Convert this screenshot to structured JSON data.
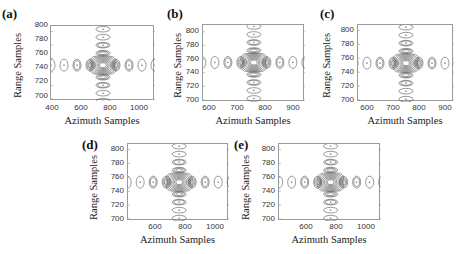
{
  "chart_data": [
    {
      "type": "contour",
      "panel": "(a)",
      "xlabel": "Azimuth Samples",
      "ylabel": "Range Samples",
      "xticks": [
        "400",
        "600",
        "800",
        "1000"
      ],
      "yticks": [
        "800",
        "780",
        "760",
        "740",
        "720",
        "700"
      ],
      "xlim": [
        390,
        1110
      ],
      "ylim": [
        697,
        808
      ],
      "peak": {
        "x": 750,
        "y": 750
      },
      "grid": false
    },
    {
      "type": "contour",
      "panel": "(b)",
      "xlabel": "Azimuth Samples",
      "ylabel": "Range Samples",
      "xticks": [
        "600",
        "700",
        "800",
        "900"
      ],
      "yticks": [
        "800",
        "780",
        "760",
        "740",
        "720",
        "700"
      ],
      "xlim": [
        570,
        935
      ],
      "ylim": [
        697,
        810
      ],
      "peak": {
        "x": 752,
        "y": 755
      },
      "grid": false
    },
    {
      "type": "contour",
      "panel": "(c)",
      "xlabel": "Azimuth Samples",
      "ylabel": "Range Samples",
      "xticks": [
        "600",
        "700",
        "800",
        "900"
      ],
      "yticks": [
        "800",
        "780",
        "760",
        "740",
        "720",
        "700"
      ],
      "xlim": [
        560,
        930
      ],
      "ylim": [
        697,
        808
      ],
      "peak": {
        "x": 745,
        "y": 753
      },
      "grid": false
    },
    {
      "type": "contour",
      "panel": "(d)",
      "xlabel": "Azimuth Samples",
      "ylabel": "Range Samples",
      "xticks": [
        "600",
        "800",
        "1000"
      ],
      "yticks": [
        "800",
        "780",
        "760",
        "740",
        "720",
        "700"
      ],
      "xlim": [
        410,
        1085
      ],
      "ylim": [
        697,
        808
      ],
      "peak": {
        "x": 752,
        "y": 753
      },
      "grid": false
    },
    {
      "type": "contour",
      "panel": "(e)",
      "xlabel": "Azimuth Samples",
      "ylabel": "Range Samples",
      "xticks": [
        "600",
        "800",
        "1000"
      ],
      "yticks": [
        "800",
        "780",
        "760",
        "740",
        "720",
        "700"
      ],
      "xlim": [
        410,
        1085
      ],
      "ylim": [
        697,
        808
      ],
      "peak": {
        "x": 752,
        "y": 753
      },
      "grid": false
    }
  ],
  "panels": [
    {
      "label": "(a)",
      "xlabel": "Azimuth Samples",
      "ylabel": "Range Samples",
      "xticks": [
        "400",
        "600",
        "800",
        "1000"
      ],
      "yticks": [
        "800",
        "780",
        "760",
        "740",
        "720",
        "700"
      ]
    },
    {
      "label": "(b)",
      "xlabel": "Azimuth Samples",
      "ylabel": "Range Samples",
      "xticks": [
        "600",
        "700",
        "800",
        "900"
      ],
      "yticks": [
        "800",
        "780",
        "760",
        "740",
        "720",
        "700"
      ]
    },
    {
      "label": "(c)",
      "xlabel": "Azimuth Samples",
      "ylabel": "Range Samples",
      "xticks": [
        "600",
        "700",
        "800",
        "900"
      ],
      "yticks": [
        "800",
        "780",
        "760",
        "740",
        "720",
        "700"
      ]
    },
    {
      "label": "(d)",
      "xlabel": "Azimuth Samples",
      "ylabel": "Range Samples",
      "xticks": [
        "600",
        "800",
        "1000"
      ],
      "yticks": [
        "800",
        "780",
        "760",
        "740",
        "720",
        "700"
      ]
    },
    {
      "label": "(e)",
      "xlabel": "Azimuth Samples",
      "ylabel": "Range Samples",
      "xticks": [
        "600",
        "800",
        "1000"
      ],
      "yticks": [
        "800",
        "780",
        "760",
        "740",
        "720",
        "700"
      ]
    }
  ],
  "colors": {
    "contour": "#555555",
    "axis": "#9a9a9a"
  }
}
